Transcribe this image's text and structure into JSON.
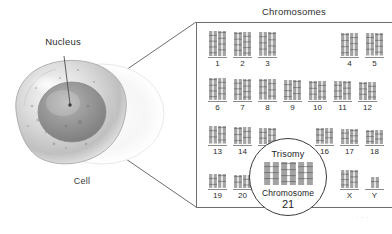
{
  "figure": {
    "cell_label": "Cell",
    "nucleus_label": "Nucleus",
    "panel_title": "Chromosomes"
  },
  "karyotype": {
    "rows": [
      {
        "left_group": [
          "1",
          "2",
          "3"
        ],
        "right_group": [
          "4",
          "5"
        ]
      },
      {
        "left_group": [
          "6",
          "7",
          "8",
          "9",
          "10",
          "11",
          "12"
        ],
        "right_group": []
      },
      {
        "left_group": [
          "13",
          "14",
          "15"
        ],
        "right_group": [
          "16",
          "17",
          "18"
        ]
      },
      {
        "left_group": [
          "19",
          "20",
          "21",
          "22"
        ],
        "right_group": [
          "X",
          "Y"
        ]
      }
    ]
  },
  "callout": {
    "trisomy_label": "Trisomy",
    "chromosome_label": "Chromosome",
    "chromosome_number": "21",
    "copy_count": 3
  },
  "watermark": {
    "text": "· · ·"
  },
  "colors": {
    "ink": "#2b2b2b",
    "rule": "#8a8a8a",
    "panel_border": "#6d6d6d",
    "chromosome": "#8f8f8f"
  }
}
